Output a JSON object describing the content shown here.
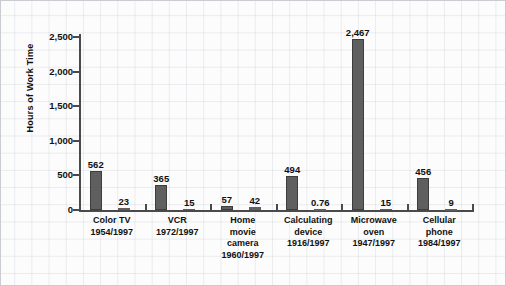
{
  "chart_data": {
    "type": "bar",
    "title": "",
    "xlabel": "",
    "ylabel": "Hours of Work Time",
    "ylim": [
      0,
      2500
    ],
    "ytick_labels": [
      "0",
      "500",
      "1,000",
      "1,500",
      "2,000",
      "2,500"
    ],
    "ytick_values": [
      0,
      500,
      1000,
      1500,
      2000,
      2500
    ],
    "grid": true,
    "legend": "none",
    "categories": [
      "Color TV\n1954/1997",
      "VCR\n1972/1997",
      "Home\nmovie\ncamera\n1960/1997",
      "Calculating\ndevice\n1916/1997",
      "Microwave\noven\n1947/1997",
      "Cellular\nphone\n1984/1997"
    ],
    "groups": [
      {
        "name": "Color TV",
        "years": "1954/1997",
        "label": "Color TV\n1954/1997",
        "bars": [
          {
            "year": "1954",
            "value": 562,
            "value_label": "562"
          },
          {
            "year": "1997",
            "value": 23,
            "value_label": "23"
          }
        ]
      },
      {
        "name": "VCR",
        "years": "1972/1997",
        "label": "VCR\n1972/1997",
        "bars": [
          {
            "year": "1972",
            "value": 365,
            "value_label": "365"
          },
          {
            "year": "1997",
            "value": 15,
            "value_label": "15"
          }
        ]
      },
      {
        "name": "Home movie camera",
        "years": "1960/1997",
        "label": "Home\nmovie\ncamera\n1960/1997",
        "bars": [
          {
            "year": "1960",
            "value": 57,
            "value_label": "57"
          },
          {
            "year": "1997",
            "value": 42,
            "value_label": "42"
          }
        ]
      },
      {
        "name": "Calculating device",
        "years": "1916/1997",
        "label": "Calculating\ndevice\n1916/1997",
        "bars": [
          {
            "year": "1916",
            "value": 494,
            "value_label": "494"
          },
          {
            "year": "1997",
            "value": 0.76,
            "value_label": "0.76"
          }
        ]
      },
      {
        "name": "Microwave oven",
        "years": "1947/1997",
        "label": "Microwave\noven\n1947/1997",
        "bars": [
          {
            "year": "1947",
            "value": 2467,
            "value_label": "2,467"
          },
          {
            "year": "1997",
            "value": 15,
            "value_label": "15"
          }
        ]
      },
      {
        "name": "Cellular phone",
        "years": "1984/1997",
        "label": "Cellular\nphone\n1984/1997",
        "bars": [
          {
            "year": "1984",
            "value": 456,
            "value_label": "456"
          },
          {
            "year": "1997",
            "value": 9,
            "value_label": "9"
          }
        ]
      }
    ],
    "colors": {
      "bar_fill": "#5f5f5f",
      "bar_stroke": "#3d3d3d",
      "axis": "#4a4a4a",
      "text": "#111111",
      "grid": "#96a0af",
      "background": "#fcfcfc"
    }
  }
}
